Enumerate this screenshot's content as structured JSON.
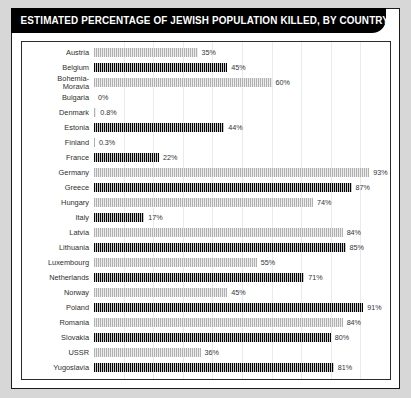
{
  "header": {
    "title": "ESTIMATED PERCENTAGE OF JEWISH POPULATION KILLED, BY COUNTRY"
  },
  "chart_data": {
    "type": "bar",
    "orientation": "horizontal",
    "title": "ESTIMATED PERCENTAGE OF JEWISH POPULATION KILLED, BY COUNTRY",
    "xlabel": "",
    "ylabel": "",
    "xlim": [
      0,
      100
    ],
    "grid": true,
    "legend": false,
    "unit": "%",
    "categories": [
      "Austria",
      "Belgium",
      "Bohemia-\nMoravia",
      "Bulgaria",
      "Denmark",
      "Estonia",
      "Finland",
      "France",
      "Germany",
      "Greece",
      "Hungary",
      "Italy",
      "Latvia",
      "Lithuania",
      "Luxembourg",
      "Netherlands",
      "Norway",
      "Poland",
      "Romania",
      "Slovakia",
      "USSR",
      "Yugoslavia"
    ],
    "values": [
      35,
      45,
      60,
      0,
      0.8,
      44,
      0.3,
      22,
      93,
      87,
      74,
      17,
      84,
      85,
      55,
      71,
      45,
      91,
      84,
      80,
      36,
      81
    ],
    "labels": [
      "35%",
      "45%",
      "60%",
      "0%",
      "0.8%",
      "44%",
      "0.3%",
      "22%",
      "93%",
      "87%",
      "74%",
      "17%",
      "84%",
      "85%",
      "55%",
      "71%",
      "45%",
      "91%",
      "84%",
      "80%",
      "36%",
      "81%"
    ],
    "bar_styles": [
      "light",
      "dark",
      "light",
      "dark",
      "light",
      "dark",
      "light",
      "dark",
      "light",
      "dark",
      "light",
      "dark",
      "light",
      "dark",
      "light",
      "dark",
      "light",
      "dark",
      "light",
      "dark",
      "light",
      "dark"
    ],
    "colors": {
      "dark": "#000000",
      "light": "#b0b0b0",
      "grid": "#e9ecef",
      "title_bar": "#000000",
      "title_text": "#ffffff"
    }
  }
}
